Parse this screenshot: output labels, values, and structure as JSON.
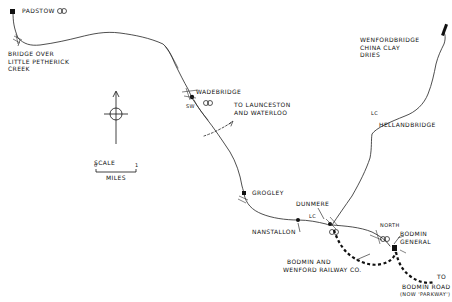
{
  "map": {
    "title": "",
    "colors": {
      "ink": "#111111",
      "background": "#ffffff"
    },
    "labels": {
      "padstow": "Padstow",
      "bridge_line1": "Bridge over",
      "bridge_line2": "Little Petherick",
      "bridge_line3": "Creek",
      "wenfordbridge_line1": "Wenfordbridge",
      "wenfordbridge_line2": "China Clay",
      "wenfordbridge_line3": "Dries",
      "wadebridge": "Wadebridge",
      "sw": "SW",
      "launceston_line1": "To Launceston",
      "launceston_line2": "and Waterloo",
      "lc_upper": "LC",
      "hellandbridge": "Hellandbridge",
      "grogley": "Grogley",
      "dunmere": "Dunmere",
      "lc_lower": "LC",
      "nanstallon": "Nanstallon",
      "north": "North",
      "bodmin_general_line1": "Bodmin",
      "bodmin_general_line2": "General",
      "bwr_line1": "Bodmin and",
      "bwr_line2": "Wenford Railway Co.",
      "to": "To",
      "bodmin_road_line1": "Bodmin Road",
      "bodmin_road_line2": "(now 'Parkway')"
    },
    "scale": {
      "title": "Scale",
      "start": "0",
      "end": "1",
      "unit": "Miles"
    },
    "compass": {
      "direction": "north-arrow"
    }
  }
}
